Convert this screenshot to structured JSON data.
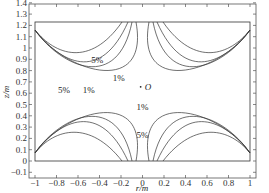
{
  "chart_data": {
    "type": "contour",
    "title": "",
    "xlabel": "r/m",
    "ylabel": "z/m",
    "xlim": [
      -1.05,
      1.05
    ],
    "ylim": [
      -0.15,
      1.4
    ],
    "x_ticks": [
      "-1",
      "-0.8",
      "-0.6",
      "-0.4",
      "-0.2",
      "0",
      "0.2",
      "0.4",
      "0.6",
      "0.8",
      "1"
    ],
    "y_ticks": [
      "-0.1",
      "0",
      "0.1",
      "0.2",
      "0.3",
      "0.4",
      "0.5",
      "0.6",
      "0.7",
      "0.8",
      "0.9",
      "1",
      "1.1",
      "1.2",
      "1.3",
      "1.4"
    ],
    "grid": false,
    "boundary_rectangle": {
      "r": [
        -1,
        1
      ],
      "z": [
        0,
        1.23
      ]
    },
    "center_point": {
      "label": "O",
      "r": 0,
      "z": 0.615
    },
    "contour_levels": [
      "1%",
      "5%"
    ],
    "annotations": [
      {
        "text": "5%",
        "r": -0.42,
        "z": 0.87
      },
      {
        "text": "1%",
        "r": -0.22,
        "z": 0.71
      },
      {
        "text": "5%",
        "r": -0.73,
        "z": 0.6
      },
      {
        "text": "1%",
        "r": -0.5,
        "z": 0.6
      },
      {
        "text": "O",
        "r": 0.02,
        "z": 0.63
      },
      {
        "text": "1%",
        "r": 0.0,
        "z": 0.45
      },
      {
        "text": "5%",
        "r": 0.0,
        "z": 0.2
      }
    ]
  }
}
